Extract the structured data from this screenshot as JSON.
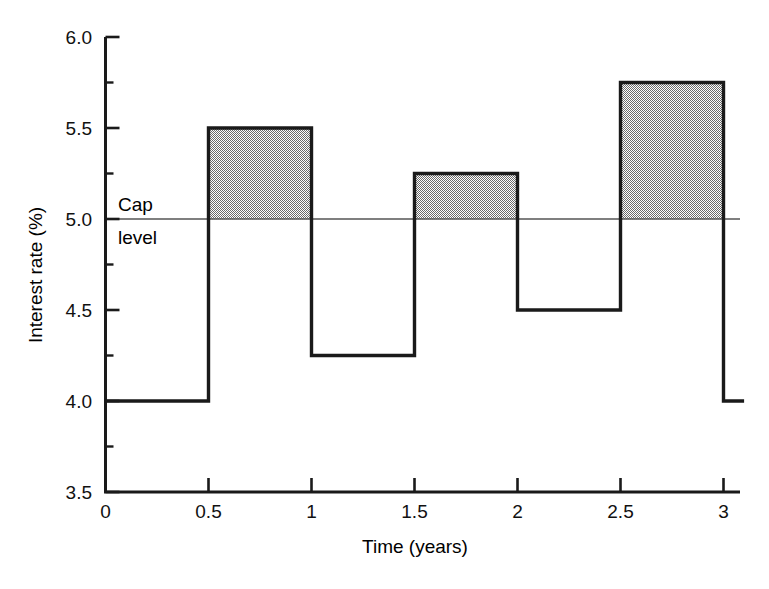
{
  "chart_data": {
    "type": "line",
    "title": "",
    "xlabel": "Time (years)",
    "ylabel": "Interest rate (%)",
    "xlim": [
      0,
      3.1
    ],
    "ylim": [
      3.5,
      6.0
    ],
    "grid": false,
    "legend": "none",
    "x_ticks": [
      "0",
      "0.5",
      "1",
      "1.5",
      "2",
      "2.5",
      "3"
    ],
    "x_tick_values": [
      0,
      0.5,
      1,
      1.5,
      2,
      2.5,
      3
    ],
    "y_ticks": [
      "3.5",
      "4.0",
      "4.5",
      "5.0",
      "5.5",
      "6.0"
    ],
    "y_tick_values": [
      3.5,
      4.0,
      4.5,
      5.0,
      5.5,
      6.0
    ],
    "y_minor_tick_values": [
      3.75,
      4.25,
      4.75,
      5.25,
      5.75
    ],
    "step_series": {
      "name": "Interest rate",
      "intervals": [
        {
          "start": 0,
          "end": 0.5,
          "value": 4.0
        },
        {
          "start": 0.5,
          "end": 1.0,
          "value": 5.5
        },
        {
          "start": 1.0,
          "end": 1.5,
          "value": 4.25
        },
        {
          "start": 1.5,
          "end": 2.0,
          "value": 5.25
        },
        {
          "start": 2.0,
          "end": 2.5,
          "value": 4.5
        },
        {
          "start": 2.5,
          "end": 3.0,
          "value": 5.75
        },
        {
          "start": 3.0,
          "end": 3.1,
          "value": 4.0
        }
      ]
    },
    "reference_line": {
      "value": 5.0,
      "label_line_1": "Cap",
      "label_line_2": "level"
    },
    "shaded_regions": [
      {
        "start": 0.5,
        "end": 1.0,
        "from": 5.0,
        "to": 5.5
      },
      {
        "start": 1.5,
        "end": 2.0,
        "from": 5.0,
        "to": 5.25
      },
      {
        "start": 2.5,
        "end": 3.0,
        "from": 5.0,
        "to": 5.75
      }
    ],
    "colors": {
      "line": "#1a1a1a",
      "shading": "#a8a8a8",
      "axis": "#1a1a1a",
      "reference_line": "#555555",
      "background": "#ffffff"
    }
  },
  "axes": {
    "y_title": "Interest rate (%)",
    "x_title": "Time (years)"
  },
  "annotations": {
    "cap_line_1": "Cap",
    "cap_line_2": "level"
  }
}
